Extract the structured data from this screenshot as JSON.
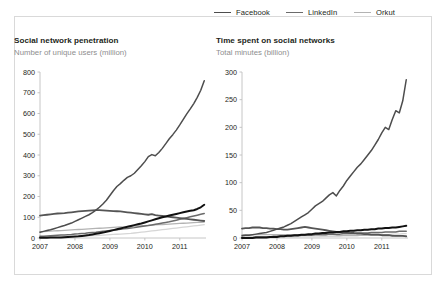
{
  "legend": {
    "items": [
      {
        "label": "Facebook",
        "color": "#4d4d4d",
        "width": 1.6,
        "col": 0,
        "row": 0
      },
      {
        "label": "Twitter",
        "color": "#111111",
        "width": 2.2,
        "col": 0,
        "row": 1
      },
      {
        "label": "LinkedIn",
        "color": "#6b6b6b",
        "width": 1.6,
        "col": 1,
        "row": 0
      },
      {
        "label": "Myspace",
        "color": "#555555",
        "width": 1.9,
        "col": 1,
        "row": 1
      },
      {
        "label": "Orkut",
        "color": "#b3b3b3",
        "width": 1.4,
        "col": 2,
        "row": 0
      },
      {
        "label": "Tumblr",
        "color": "#d6d6d6",
        "width": 1.4,
        "col": 2,
        "row": 1
      }
    ]
  },
  "panels": {
    "left": {
      "title": "Social network penetration",
      "subtitle": "Number of unique users (million)"
    },
    "right": {
      "title": "Time spent on social networks",
      "subtitle": "Total minutes (billion)"
    }
  },
  "chart_data": [
    {
      "type": "line",
      "title": "Social network penetration",
      "subtitle": "Number of unique users (million)",
      "xlabel": "",
      "ylabel": "Number of unique users (million)",
      "xlim": [
        2007.0,
        2011.75
      ],
      "ylim": [
        0,
        800
      ],
      "yticks": [
        0,
        100,
        200,
        300,
        400,
        500,
        600,
        700,
        800
      ],
      "xticks": [
        2007,
        2008,
        2009,
        2010,
        2011
      ],
      "xtick_labels": [
        "2007",
        "2008",
        "2009",
        "2010",
        "2011"
      ],
      "grid": false,
      "legend_position": "top-right-outside",
      "x": [
        2007.0,
        2007.1,
        2007.2,
        2007.3,
        2007.4,
        2007.5,
        2007.6,
        2007.7,
        2007.8,
        2007.9,
        2008.0,
        2008.1,
        2008.2,
        2008.3,
        2008.4,
        2008.5,
        2008.6,
        2008.7,
        2008.8,
        2008.9,
        2009.0,
        2009.1,
        2009.2,
        2009.3,
        2009.4,
        2009.5,
        2009.6,
        2009.7,
        2009.8,
        2009.9,
        2010.0,
        2010.1,
        2010.2,
        2010.3,
        2010.4,
        2010.5,
        2010.6,
        2010.7,
        2010.8,
        2010.9,
        2011.0,
        2011.1,
        2011.2,
        2011.3,
        2011.4,
        2011.5,
        2011.6,
        2011.7
      ],
      "series": [
        {
          "name": "Facebook",
          "color": "#4d4d4d",
          "width": 1.5,
          "values": [
            28,
            32,
            36,
            40,
            45,
            50,
            55,
            60,
            66,
            72,
            80,
            88,
            96,
            104,
            112,
            122,
            134,
            148,
            164,
            182,
            205,
            228,
            248,
            262,
            278,
            292,
            300,
            312,
            330,
            348,
            368,
            392,
            402,
            396,
            412,
            432,
            455,
            478,
            498,
            520,
            545,
            572,
            598,
            622,
            648,
            678,
            712,
            758
          ]
        },
        {
          "name": "Twitter",
          "color": "#111111",
          "width": 2.0,
          "values": [
            1,
            1,
            1,
            2,
            2,
            3,
            3,
            4,
            5,
            6,
            7,
            8,
            10,
            12,
            14,
            17,
            20,
            23,
            26,
            30,
            34,
            38,
            42,
            46,
            50,
            54,
            58,
            62,
            66,
            70,
            75,
            80,
            85,
            90,
            95,
            100,
            104,
            108,
            112,
            116,
            120,
            124,
            128,
            131,
            134,
            140,
            148,
            160
          ]
        },
        {
          "name": "LinkedIn",
          "color": "#6b6b6b",
          "width": 1.5,
          "values": [
            8,
            9,
            10,
            11,
            12,
            13,
            14,
            15,
            16,
            17,
            19,
            20,
            22,
            23,
            25,
            27,
            28,
            30,
            32,
            34,
            36,
            38,
            40,
            42,
            44,
            46,
            48,
            50,
            53,
            55,
            58,
            60,
            63,
            66,
            69,
            72,
            75,
            78,
            82,
            86,
            90,
            94,
            98,
            102,
            106,
            110,
            114,
            118
          ]
        },
        {
          "name": "Myspace",
          "color": "#555555",
          "width": 1.8,
          "values": [
            108,
            110,
            112,
            114,
            116,
            118,
            119,
            120,
            122,
            124,
            126,
            128,
            130,
            131,
            132,
            133,
            134,
            134,
            133,
            132,
            131,
            130,
            129,
            128,
            126,
            124,
            122,
            120,
            118,
            116,
            114,
            112,
            115,
            110,
            108,
            106,
            104,
            102,
            100,
            98,
            96,
            94,
            92,
            90,
            88,
            86,
            84,
            82
          ]
        },
        {
          "name": "Orkut",
          "color": "#b3b3b3",
          "width": 1.3,
          "values": [
            30,
            31,
            32,
            33,
            34,
            35,
            36,
            37,
            38,
            39,
            40,
            41,
            42,
            43,
            44,
            45,
            46,
            47,
            48,
            49,
            50,
            51,
            52,
            53,
            54,
            55,
            56,
            57,
            58,
            59,
            60,
            61,
            62,
            63,
            64,
            65,
            66,
            67,
            68,
            69,
            70,
            71,
            72,
            73,
            74,
            75,
            76,
            77
          ]
        },
        {
          "name": "Tumblr",
          "color": "#d6d6d6",
          "width": 1.3,
          "values": [
            2,
            2,
            3,
            3,
            4,
            4,
            5,
            5,
            6,
            6,
            7,
            8,
            8,
            9,
            10,
            11,
            12,
            13,
            14,
            15,
            16,
            17,
            18,
            19,
            20,
            21,
            22,
            24,
            26,
            28,
            30,
            32,
            34,
            36,
            38,
            40,
            42,
            44,
            46,
            48,
            50,
            52,
            54,
            56,
            58,
            60,
            62,
            64
          ]
        }
      ]
    },
    {
      "type": "line",
      "title": "Time spent on social networks",
      "subtitle": "Total minutes (billion)",
      "xlabel": "",
      "ylabel": "Total minutes (billion)",
      "xlim": [
        2007.0,
        2011.75
      ],
      "ylim": [
        0,
        300
      ],
      "yticks": [
        0,
        50,
        100,
        150,
        200,
        250,
        300
      ],
      "xticks": [
        2007,
        2008,
        2009,
        2010,
        2011
      ],
      "xtick_labels": [
        "2007",
        "2008",
        "2009",
        "2010",
        "2011"
      ],
      "grid": false,
      "legend_position": "top-right-outside",
      "x": [
        2007.0,
        2007.1,
        2007.2,
        2007.3,
        2007.4,
        2007.5,
        2007.6,
        2007.7,
        2007.8,
        2007.9,
        2008.0,
        2008.1,
        2008.2,
        2008.3,
        2008.4,
        2008.5,
        2008.6,
        2008.7,
        2008.8,
        2008.9,
        2009.0,
        2009.1,
        2009.2,
        2009.3,
        2009.4,
        2009.5,
        2009.6,
        2009.7,
        2009.8,
        2009.9,
        2010.0,
        2010.1,
        2010.2,
        2010.3,
        2010.4,
        2010.5,
        2010.6,
        2010.7,
        2010.8,
        2010.9,
        2011.0,
        2011.1,
        2011.2,
        2011.3,
        2011.4,
        2011.5,
        2011.6,
        2011.7
      ],
      "series": [
        {
          "name": "Facebook",
          "color": "#4d4d4d",
          "width": 1.5,
          "values": [
            4,
            5,
            5,
            6,
            7,
            8,
            9,
            10,
            12,
            14,
            16,
            18,
            20,
            23,
            26,
            30,
            34,
            38,
            42,
            46,
            52,
            58,
            62,
            66,
            72,
            78,
            82,
            76,
            86,
            94,
            104,
            112,
            120,
            128,
            134,
            142,
            150,
            158,
            168,
            178,
            190,
            200,
            196,
            214,
            230,
            226,
            248,
            286
          ]
        },
        {
          "name": "Twitter",
          "color": "#111111",
          "width": 2.0,
          "values": [
            0,
            0,
            0,
            0,
            1,
            1,
            1,
            1,
            2,
            2,
            2,
            3,
            3,
            4,
            4,
            5,
            5,
            6,
            6,
            7,
            7,
            8,
            8,
            9,
            9,
            10,
            10,
            11,
            11,
            12,
            12,
            13,
            13,
            14,
            14,
            15,
            15,
            16,
            16,
            17,
            17,
            18,
            18,
            19,
            19,
            20,
            21,
            22
          ]
        },
        {
          "name": "LinkedIn",
          "color": "#6b6b6b",
          "width": 1.5,
          "values": [
            1,
            1,
            1,
            1,
            2,
            2,
            2,
            2,
            2,
            3,
            3,
            3,
            3,
            4,
            4,
            4,
            4,
            5,
            5,
            5,
            5,
            6,
            6,
            6,
            6,
            7,
            7,
            7,
            7,
            8,
            8,
            8,
            8,
            9,
            9,
            9,
            9,
            10,
            10,
            10,
            10,
            11,
            11,
            11,
            11,
            12,
            12,
            12
          ]
        },
        {
          "name": "Myspace",
          "color": "#555555",
          "width": 1.8,
          "values": [
            17,
            18,
            18,
            19,
            19,
            19,
            18,
            18,
            17,
            17,
            16,
            16,
            15,
            15,
            16,
            17,
            18,
            19,
            20,
            19,
            18,
            17,
            16,
            15,
            14,
            13,
            12,
            11,
            11,
            10,
            10,
            9,
            9,
            8,
            8,
            7,
            7,
            6,
            6,
            6,
            5,
            5,
            5,
            4,
            4,
            4,
            4,
            3
          ]
        },
        {
          "name": "Orkut",
          "color": "#b3b3b3",
          "width": 1.3,
          "values": [
            6,
            6,
            6,
            6,
            6,
            6,
            6,
            6,
            6,
            6,
            6,
            6,
            6,
            6,
            6,
            6,
            6,
            6,
            6,
            6,
            6,
            6,
            6,
            6,
            6,
            6,
            6,
            5,
            5,
            5,
            5,
            5,
            5,
            5,
            5,
            5,
            5,
            5,
            5,
            5,
            5,
            5,
            5,
            5,
            4,
            4,
            4,
            4
          ]
        },
        {
          "name": "Tumblr",
          "color": "#d6d6d6",
          "width": 1.3,
          "values": [
            0,
            0,
            0,
            0,
            0,
            0,
            0,
            1,
            1,
            1,
            1,
            1,
            1,
            1,
            1,
            1,
            2,
            2,
            2,
            2,
            2,
            2,
            2,
            3,
            3,
            3,
            3,
            3,
            3,
            4,
            4,
            4,
            4,
            4,
            5,
            5,
            5,
            5,
            5,
            6,
            6,
            6,
            6,
            7,
            7,
            7,
            8,
            8
          ]
        }
      ]
    }
  ]
}
